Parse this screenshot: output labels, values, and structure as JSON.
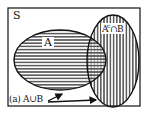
{
  "diagram": {
    "type": "venn",
    "universe_label": "S",
    "sets": [
      {
        "name": "A",
        "label": "A",
        "fill_pattern": "horizontal-stripes"
      },
      {
        "name": "B",
        "label": "",
        "fill_pattern": "vertical-stripes"
      }
    ],
    "region_labels": {
      "complement_a_intersect_b": {
        "base": "A",
        "superscript": "c",
        "rest": "∩B"
      },
      "union_caption": "(a) A∪B"
    },
    "colors": {
      "line": "#111111",
      "background": "#ffffff"
    }
  }
}
